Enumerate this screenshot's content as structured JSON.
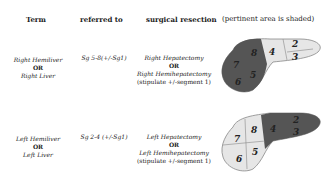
{
  "headers": {
    "term": "Term",
    "referred_to": "referred to",
    "surgical_resection": "surgical resection",
    "diagram": "(pertinent area is shaded)"
  },
  "rows": [
    {
      "term_line1": "Right Hemiliver",
      "term_or": "OR",
      "term_line2": "Right Liver",
      "referred_to": "Sg 5-8(+/-Sg1)",
      "resection_line1": "Right Hepatectomy",
      "resection_or": "OR",
      "resection_line2": "Right Hemihepatectomy",
      "resection_note": "(stipulate +/-segment 1)",
      "segments": [
        "2",
        "3",
        "4",
        "5",
        "6",
        "7",
        "8"
      ],
      "shaded": [
        "5",
        "6",
        "7",
        "8"
      ]
    },
    {
      "term_line1": "Left Hemiliver",
      "term_or": "OR",
      "term_line2": "Left Liver",
      "referred_to": "Sg 2-4 (+/-Sg1)",
      "resection_line1": "Left Hepatectomy",
      "resection_or": "OR",
      "resection_line2": "Left Hemihepatectomy",
      "resection_note": "(stipulate +/-segment 1)",
      "segments": [
        "2",
        "3",
        "4",
        "5",
        "6",
        "7",
        "8"
      ],
      "shaded": [
        "2",
        "3",
        "4"
      ]
    }
  ],
  "colors": {
    "shaded": "#555555",
    "unshaded": "#e6e6e6",
    "outline": "#888888"
  }
}
